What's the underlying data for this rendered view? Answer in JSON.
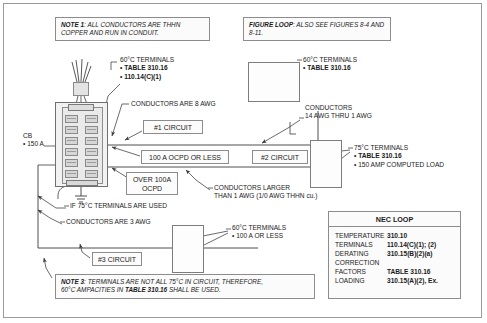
{
  "notes": {
    "note1": {
      "label": "NOTE 1",
      "text": ": ALL CONDUCTORS ARE THHN COPPER AND RUN IN CONDUIT."
    },
    "figure_loop": {
      "label": "FIGURE LOOP",
      "text": ": ALSO SEE FIGURES 8-4 AND 8-11."
    },
    "note3": {
      "label": "NOTE 3",
      "text_a": ":  TERMINALS ARE NOT ALL 75°C IN CIRCUIT, THEREFORE,",
      "text_b": "60°C AMPACITIES IN ",
      "text_bold": "TABLE 310.16",
      "text_c": " SHALL BE USED."
    }
  },
  "chips": {
    "circuit1": "#1 CIRCUIT",
    "circuit2": "#2 CIRCUIT",
    "circuit3": "#3 CIRCUIT",
    "ocpd_100": "100 A OCPD OR LESS",
    "ocpd_over_100_line1": "OVER 100A",
    "ocpd_over_100_line2": "OCPD"
  },
  "callouts": {
    "panel_terminals": {
      "line1": "60°C TERMINALS",
      "line2": "• TABLE 310.16",
      "line3": "• 110.14(C)(1)"
    },
    "conductors_8awg": "CONDUCTORS ARE 8 AWG",
    "top_box_terminals": {
      "line1": "60°C TERMINALS",
      "line2": "• TABLE 310.16"
    },
    "conductors_14_thru_1": {
      "line1": "CONDUCTORS",
      "line2": "14 AWG THRU 1 AWG"
    },
    "terminals_75c": {
      "line1": "75°C TERMINALS",
      "line2": "• TABLE 310.16",
      "line3": "• 150 AMP COMPUTED LOAD"
    },
    "conductors_larger": {
      "line1": "CONDUCTORS LARGER",
      "line2": "THAN 1 AWG (1/0 AWG THHN cu.)"
    },
    "if_75c_used": "IF 75°C TERMINALS ARE USED",
    "conductors_3awg": "CONDUCTORS ARE 3 AWG",
    "terminals_60c_100a": {
      "line1": "60°C TERMINALS",
      "line2": "• 100 A OR LESS"
    },
    "cb": {
      "line1": "CB",
      "line2": "• 150 A"
    }
  },
  "nec_loop": {
    "title": "NEC LOOP",
    "rows": [
      {
        "key": "TEMPERATURE",
        "value": "310.10"
      },
      {
        "key": "TERMINALS",
        "value": "110.14(C)(1); (2)"
      },
      {
        "key": "DERATING",
        "value": "310.15(B)(2)(a)"
      },
      {
        "key": "CORRECTION",
        "value": ""
      },
      {
        "key": "FACTORS",
        "value": "TABLE 310.16"
      },
      {
        "key": "LOADING",
        "value": "310.15(A)(2), Ex."
      }
    ]
  },
  "colors": {
    "line": "#3a3a3a",
    "border": "#8c8c8c",
    "panel_fill": "#f2f2f2",
    "breaker_fill": "#d6d6d6"
  }
}
